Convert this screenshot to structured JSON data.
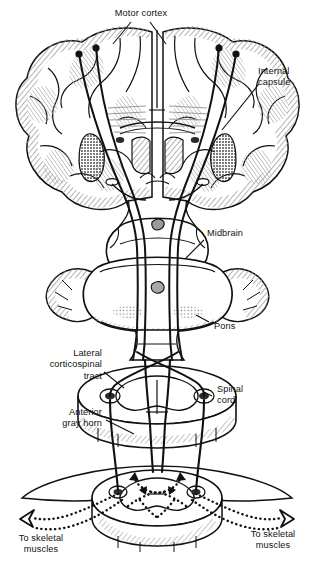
{
  "figure": {
    "background_color": "#ffffff",
    "ink_color": "#111111",
    "shading_color": "#8d8d8d",
    "dark_nucleus_color": "#3a3a3a"
  },
  "labels": {
    "motor_cortex": "Motor cortex",
    "internal_capsule": "Internal\ncapsule",
    "midbrain": "Midbrain",
    "pons": "Pons",
    "lateral_corticospinal_tract": "Lateral\ncorticospinal\ntract",
    "spinal_cord": "Spinal\ncord",
    "anterior_gray_horn": "Anterior\ngray horn",
    "to_skeletal_muscles_left": "To skeletal\nmuscles",
    "to_skeletal_muscles_right": "To skeletal\nmuscles"
  },
  "structures": [
    {
      "name": "cerebrum",
      "note": "coronal section with gyri and sulci, hatched cortex"
    },
    {
      "name": "internal-capsule",
      "note": "dark stippled band deep in each hemisphere"
    },
    {
      "name": "midbrain",
      "note": "cerebral peduncles, hatched margins"
    },
    {
      "name": "pons",
      "note": "rounded bulge flanked by cerebellar tissue"
    },
    {
      "name": "medulla-decussation",
      "note": "pyramidal fibers cross to opposite side"
    },
    {
      "name": "spinal-cord-upper",
      "note": "cross section with butterfly gray matter"
    },
    {
      "name": "spinal-cord-lower",
      "note": "cross section with anterior gray horns"
    }
  ],
  "pathway": {
    "upper_motor_neuron_cell_bodies": 4,
    "descending_tract_lines": 4,
    "decussation_present": true,
    "peripheral_nerve_style": "dotted",
    "terminal_arrow_style": "hollow-outline",
    "terminal_arrow_count": 2
  }
}
